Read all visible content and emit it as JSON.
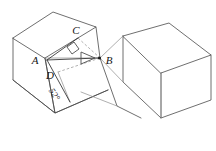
{
  "figure": {
    "kind": "geometry-diagram",
    "background_color": "#ffffff",
    "line_color": "#4a4a4a",
    "dashed_color": "#9a9a9a",
    "label_color": "#141414",
    "labels": {
      "a": "A",
      "b": "B",
      "c": "C",
      "d": "D",
      "angle": "52°"
    },
    "marks": {
      "right_angle": "right-angle-square",
      "direction_arrow": "arrowhead-pointing-to-B"
    }
  }
}
